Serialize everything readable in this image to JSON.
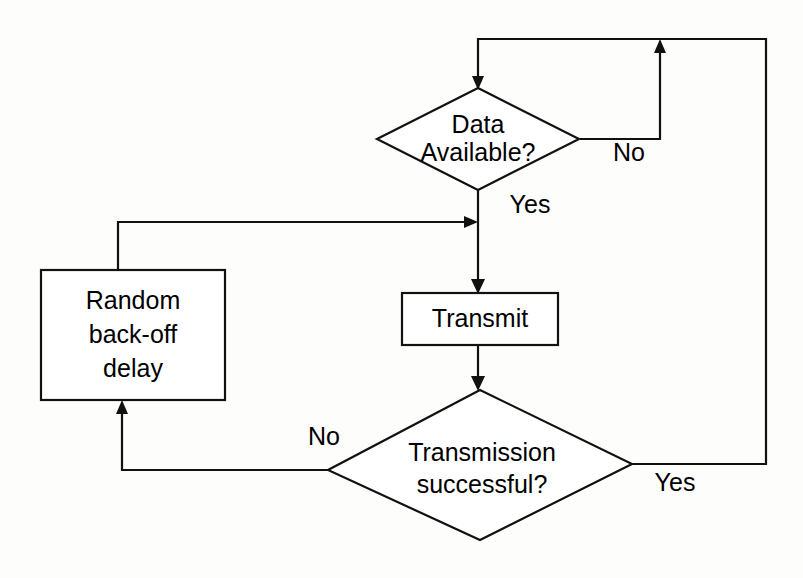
{
  "diagram": {
    "type": "flowchart",
    "canvas": {
      "width": 803,
      "height": 578
    },
    "colors": {
      "background": "#fdfdfc",
      "stroke": "#111111",
      "shape_fill": "#ffffff",
      "text": "#000000"
    },
    "nodes": [
      {
        "id": "data-available",
        "shape": "diamond",
        "line1": "Data",
        "line2": "Available?",
        "center_x": 478,
        "center_y": 139,
        "half_width": 101,
        "half_height": 51
      },
      {
        "id": "transmit",
        "shape": "rectangle",
        "line1": "Transmit",
        "line2": "",
        "x": 402,
        "y": 293,
        "width": 156,
        "height": 52
      },
      {
        "id": "random-backoff-delay",
        "shape": "rectangle",
        "line1": "Random",
        "line2": "back-off",
        "line3": "delay",
        "x": 41,
        "y": 270,
        "width": 184,
        "height": 130
      },
      {
        "id": "transmission-successful",
        "shape": "diamond",
        "line1": "Transmission",
        "line2": "successful?",
        "center_x": 480,
        "center_y": 465,
        "half_width": 152,
        "half_height": 75
      }
    ],
    "edge_labels": [
      {
        "id": "data-available-no",
        "text": "No",
        "x": 629,
        "y": 154
      },
      {
        "id": "data-available-yes",
        "text": "Yes",
        "x": 530,
        "y": 206
      },
      {
        "id": "transmission-no",
        "text": "No",
        "x": 324,
        "y": 438
      },
      {
        "id": "transmission-yes",
        "text": "Yes",
        "x": 675,
        "y": 484
      }
    ],
    "edges": [
      {
        "id": "no-loop-to-top",
        "from": "data-available",
        "to": "data-available",
        "label": "No"
      },
      {
        "id": "yes-to-transmit",
        "from": "data-available",
        "to": "transmit",
        "label": "Yes"
      },
      {
        "id": "transmit-to-check",
        "from": "transmit",
        "to": "transmission-successful",
        "label": ""
      },
      {
        "id": "no-to-backoff",
        "from": "transmission-successful",
        "to": "random-backoff-delay",
        "label": "No"
      },
      {
        "id": "backoff-to-transmit-path",
        "from": "random-backoff-delay",
        "to": "transmit",
        "label": ""
      },
      {
        "id": "yes-to-start",
        "from": "transmission-successful",
        "to": "data-available",
        "label": "Yes"
      }
    ]
  }
}
